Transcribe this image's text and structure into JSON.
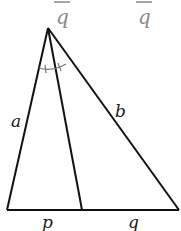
{
  "diagram": {
    "type": "triangle-angle-bisector",
    "top_fragments": [
      {
        "text": "q",
        "x": 62,
        "y": 22
      },
      {
        "text": "q",
        "x": 138,
        "y": 22
      }
    ],
    "labels": {
      "side_left": "a",
      "side_right": "b",
      "base_left": "p",
      "base_right": "q"
    },
    "points": {
      "apex": [
        48,
        28
      ],
      "base_left": [
        7,
        210
      ],
      "base_right": [
        179,
        210
      ],
      "bisector_foot": [
        82,
        210
      ]
    }
  }
}
